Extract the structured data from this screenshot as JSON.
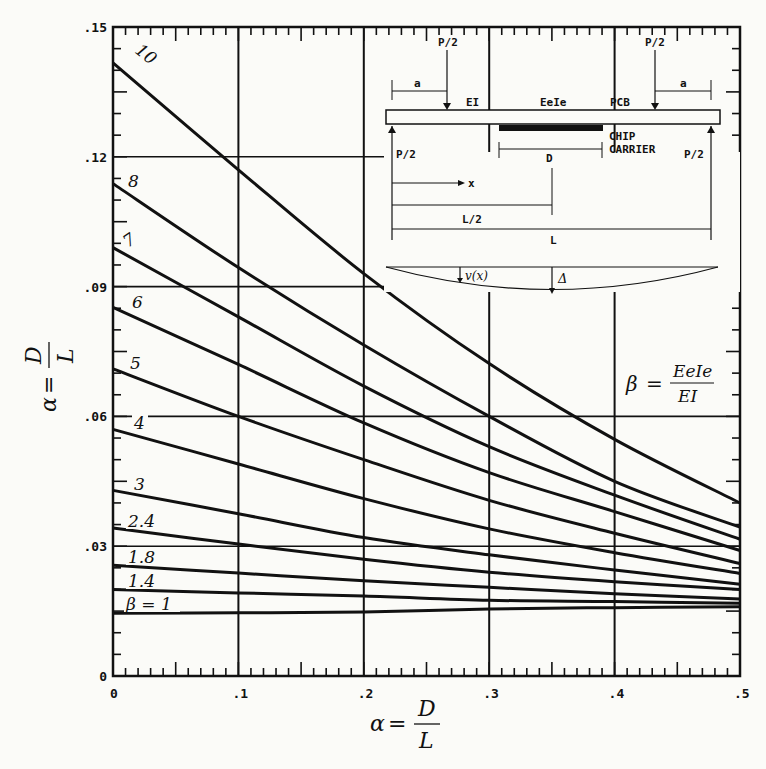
{
  "chart_data": {
    "type": "line",
    "title": "",
    "xlabel": "α = D/L",
    "ylabel": "α = D/L",
    "xlim": [
      0,
      0.5
    ],
    "ylim": [
      0,
      0.15
    ],
    "grid": true,
    "x_ticks": [
      "0",
      ".1",
      ".2",
      ".3",
      ".4",
      ".5"
    ],
    "y_ticks": [
      "0",
      ".03",
      ".06",
      ".09",
      ".12",
      ".15"
    ],
    "x": [
      0,
      0.1,
      0.2,
      0.3,
      0.4,
      0.5
    ],
    "series": [
      {
        "name": "10",
        "label": "10",
        "values": [
          0.1417,
          0.117,
          0.093,
          0.0722,
          0.0547,
          0.04
        ]
      },
      {
        "name": "8",
        "label": "8",
        "values": [
          0.1138,
          0.0944,
          0.0765,
          0.06,
          0.045,
          0.0344
        ]
      },
      {
        "name": "7",
        "label": "7",
        "values": [
          0.099,
          0.083,
          0.067,
          0.053,
          0.0418,
          0.0316
        ]
      },
      {
        "name": "6",
        "label": "6",
        "values": [
          0.0852,
          0.072,
          0.0585,
          0.047,
          0.038,
          0.029
        ]
      },
      {
        "name": "5",
        "label": "5",
        "values": [
          0.071,
          0.06,
          0.05,
          0.0406,
          0.033,
          0.026
        ]
      },
      {
        "name": "4",
        "label": "4",
        "values": [
          0.057,
          0.049,
          0.041,
          0.034,
          0.0285,
          0.0237
        ]
      },
      {
        "name": "3",
        "label": "3",
        "values": [
          0.0429,
          0.0375,
          0.032,
          0.028,
          0.0245,
          0.0212
        ]
      },
      {
        "name": "2.4",
        "label": "2.4",
        "values": [
          0.0342,
          0.0305,
          0.027,
          0.024,
          0.0218,
          0.02
        ]
      },
      {
        "name": "1.8",
        "label": "1.8",
        "values": [
          0.0256,
          0.0238,
          0.022,
          0.0205,
          0.019,
          0.0178
        ]
      },
      {
        "name": "1.4",
        "label": "1.4",
        "values": [
          0.02,
          0.0192,
          0.0185,
          0.0175,
          0.0172,
          0.0168
        ]
      },
      {
        "name": "1",
        "label": "β = 1",
        "values": [
          0.0145,
          0.0146,
          0.0148,
          0.0155,
          0.0158,
          0.016
        ]
      }
    ],
    "annotations": [
      "β = EeIe / EI"
    ]
  },
  "axes": {
    "x_label_var": "α",
    "x_label_num": "D",
    "x_label_den": "L",
    "y_label_var": "α",
    "y_label_num": "D",
    "y_label_den": "L"
  },
  "beta_formula": {
    "lhs": "β",
    "num": "EeIe",
    "den": "EI"
  },
  "inset": {
    "load_top_left": "P/2",
    "load_top_right": "P/2",
    "load_bottom_left": "P/2",
    "load_bottom_right": "P/2",
    "dim_a_left": "a",
    "dim_a_right": "a",
    "label_EI": "EI",
    "label_EeIe": "EeIe",
    "label_PCB": "PCB",
    "label_chip": "CHIP",
    "label_carrier": "CARRIER",
    "dim_D": "D",
    "dim_x": "x",
    "dim_L2": "L/2",
    "dim_L": "L",
    "label_vx": "v(x)",
    "label_delta": "Δ"
  }
}
